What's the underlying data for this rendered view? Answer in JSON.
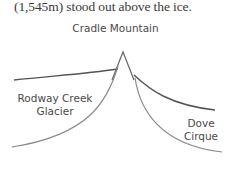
{
  "caption": "(1,545m) stood out above the ice.",
  "diagram": {
    "peak_label": "Cradle Mountain",
    "left_glacier_label": "Rodway Creek Glacier",
    "right_glacier_label": "Dove Cirque",
    "left_label_lines": [
      "Rodway Creek",
      "Glacier"
    ],
    "right_label_lines": [
      "Dove",
      "Cirque"
    ],
    "colors": {
      "line_dark": "#555555",
      "line_light": "#8a8a8a",
      "text": "#4a4a4a"
    }
  }
}
